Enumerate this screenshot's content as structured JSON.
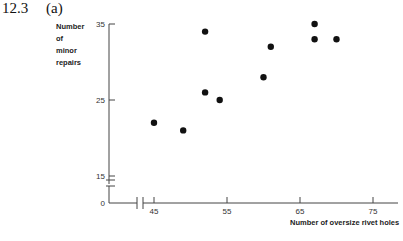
{
  "heading": {
    "number": "12.3",
    "part": "(a)"
  },
  "chart_data": {
    "type": "scatter",
    "title": "",
    "xlabel": "Number of oversize rivet holes",
    "ylabel": "Number of minor repairs",
    "ylabel_lines": [
      "Number",
      "of",
      "minor",
      "repairs"
    ],
    "x_ticks": [
      45,
      55,
      65,
      75
    ],
    "y_ticks": [
      0,
      15,
      25,
      35
    ],
    "xlim": [
      45,
      75
    ],
    "ylim": [
      15,
      35
    ],
    "axis_breaks": {
      "x": true,
      "y": true
    },
    "grid": false,
    "legend": null,
    "points": [
      {
        "x": 45,
        "y": 22
      },
      {
        "x": 49,
        "y": 21
      },
      {
        "x": 52,
        "y": 34
      },
      {
        "x": 52,
        "y": 26
      },
      {
        "x": 54,
        "y": 25
      },
      {
        "x": 60,
        "y": 28
      },
      {
        "x": 61,
        "y": 32
      },
      {
        "x": 67,
        "y": 35
      },
      {
        "x": 67,
        "y": 33
      },
      {
        "x": 70,
        "y": 33
      }
    ],
    "marker_color": "#111111",
    "axis_color": "#444444"
  }
}
